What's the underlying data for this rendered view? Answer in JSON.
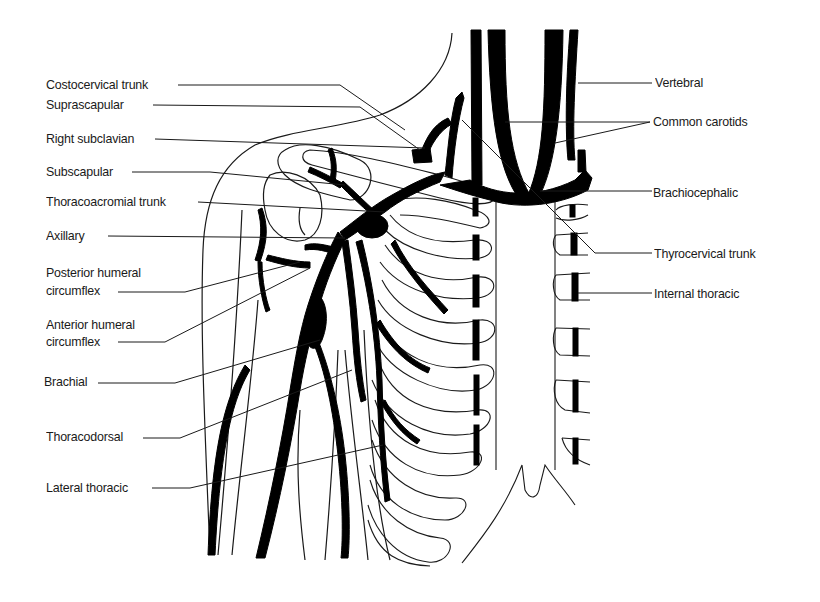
{
  "diagram": {
    "title": "",
    "colors": {
      "vessel": "#000000",
      "outline": "#1a1a1a",
      "background": "#ffffff"
    },
    "labels_left": [
      {
        "id": "costocervical",
        "text": "Costocervical trunk",
        "x": 46,
        "y": 78
      },
      {
        "id": "suprascapular",
        "text": "Suprascapular",
        "x": 46,
        "y": 98
      },
      {
        "id": "right-subclavian",
        "text": "Right subclavian",
        "x": 46,
        "y": 131
      },
      {
        "id": "subscapular",
        "text": "Subscapular",
        "x": 46,
        "y": 165
      },
      {
        "id": "thoracoacromial",
        "text": "Thoracoacromial trunk",
        "x": 46,
        "y": 195
      },
      {
        "id": "axillary",
        "text": "Axillary",
        "x": 46,
        "y": 228
      },
      {
        "id": "posterior-humeral-1",
        "text": "Posterior humeral",
        "x": 46,
        "y": 265
      },
      {
        "id": "posterior-humeral-2",
        "text": "circumflex",
        "x": 46,
        "y": 282
      },
      {
        "id": "anterior-humeral-1",
        "text": "Anterior humeral",
        "x": 46,
        "y": 317
      },
      {
        "id": "anterior-humeral-2",
        "text": "circumflex",
        "x": 46,
        "y": 334
      },
      {
        "id": "brachial",
        "text": "Brachial",
        "x": 44,
        "y": 374
      },
      {
        "id": "thoracodorsal",
        "text": "Thoracodorsal",
        "x": 46,
        "y": 428
      },
      {
        "id": "lateral-thoracic",
        "text": "Lateral thoracic",
        "x": 46,
        "y": 480
      }
    ],
    "labels_right": [
      {
        "id": "vertebral",
        "text": "Vertebral",
        "x": 654,
        "y": 75
      },
      {
        "id": "common-carotids",
        "text": "Common carotids",
        "x": 653,
        "y": 114
      },
      {
        "id": "brachiocephalic",
        "text": "Brachiocephalic",
        "x": 653,
        "y": 185
      },
      {
        "id": "thyrocervical",
        "text": "Thyrocervical trunk",
        "x": 654,
        "y": 246
      },
      {
        "id": "internal-thoracic",
        "text": "Internal thoracic",
        "x": 654,
        "y": 286
      }
    ]
  }
}
